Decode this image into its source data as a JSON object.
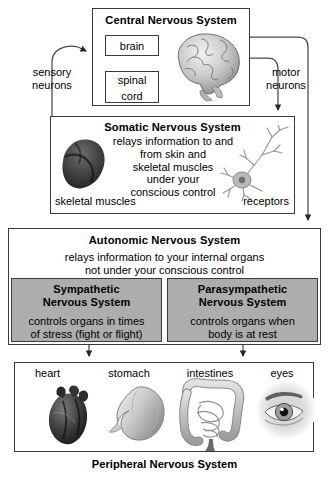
{
  "diagram": {
    "caption": "Peripheral Nervous System"
  },
  "cns": {
    "title": "Central Nervous System",
    "brain_label": "brain",
    "spinal_cord_label_line1": "spinal",
    "spinal_cord_label_line2": "cord",
    "art": "brain-illustration"
  },
  "connectors": {
    "sensory_label_line1": "sensory",
    "sensory_label_line2": "neurons",
    "motor_label_line1": "motor",
    "motor_label_line2": "neurons"
  },
  "somatic": {
    "title": "Somatic Nervous System",
    "body_lines": [
      "relays information to and",
      "from skin and",
      "skeletal muscles",
      "under your",
      "conscious control"
    ],
    "left_label": "skeletal muscles",
    "right_label": "receptors",
    "art_left": "skeletal-muscle-illustration",
    "art_right": "neuron-illustration"
  },
  "autonomic": {
    "title": "Autonomic Nervous System",
    "body_lines": [
      "relays information to your internal organs",
      "not under your conscious control"
    ],
    "sympathetic": {
      "title_line1": "Sympathetic",
      "title_line2": "Nervous System",
      "body_line1": "controls organs in times",
      "body_line2": "of stress (fight or flight)"
    },
    "parasympathetic": {
      "title_line1": "Parasympathetic",
      "title_line2": "Nervous System",
      "body_line1": "controls organs when",
      "body_line2": "body is at rest"
    }
  },
  "organs": [
    {
      "label": "heart",
      "art": "heart-illustration"
    },
    {
      "label": "stomach",
      "art": "stomach-illustration"
    },
    {
      "label": "intestines",
      "art": "intestines-illustration"
    },
    {
      "label": "eyes",
      "art": "eye-illustration"
    }
  ],
  "colors": {
    "border": "#3a3a3a",
    "subbox_fill": "#adadad",
    "background": "#ffffff",
    "text": "#000000"
  }
}
